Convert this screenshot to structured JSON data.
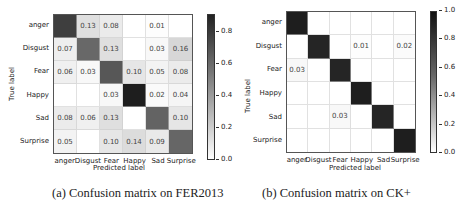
{
  "chart_data": [
    {
      "type": "heatmap",
      "title": "Confusion matrix on FER2013",
      "caption": "(a) Confusion matrix on FER2013",
      "xlabel": "Predicted label",
      "ylabel": "True label",
      "categories": [
        "anger",
        "Disgust",
        "Fear",
        "Happy",
        "Sad",
        "Surprise"
      ],
      "values": [
        [
          0.78,
          0.13,
          0.08,
          0.0,
          0.01,
          0.0
        ],
        [
          0.07,
          0.61,
          0.13,
          0.0,
          0.03,
          0.16
        ],
        [
          0.06,
          0.03,
          0.68,
          0.1,
          0.05,
          0.08
        ],
        [
          0.0,
          0.0,
          0.03,
          0.91,
          0.02,
          0.04
        ],
        [
          0.08,
          0.06,
          0.13,
          0.0,
          0.63,
          0.1
        ],
        [
          0.05,
          0.0,
          0.1,
          0.14,
          0.09,
          0.62
        ]
      ],
      "cell_labels": [
        [
          "",
          "0.13",
          "0.08",
          "",
          "0.01",
          ""
        ],
        [
          "0.07",
          "",
          "0.13",
          "",
          "0.03",
          "0.16"
        ],
        [
          "0.06",
          "0.03",
          "",
          "0.10",
          "0.05",
          "0.08"
        ],
        [
          "",
          "",
          "0.03",
          "",
          "0.02",
          "0.04"
        ],
        [
          "0.08",
          "0.06",
          "0.13",
          "",
          "",
          "0.10"
        ],
        [
          "0.05",
          "",
          "0.10",
          "0.14",
          "0.09",
          ""
        ]
      ],
      "colorbar": {
        "range": [
          0.0,
          0.91
        ],
        "ticks": [
          "0.0",
          "0.2",
          "0.4",
          "0.6",
          "0.8"
        ],
        "cmap": "Greys"
      }
    },
    {
      "type": "heatmap",
      "title": "Confusion matrix on CK+",
      "caption": "(b) Confusion matrix on CK+",
      "xlabel": "Predicted label",
      "ylabel": "True label",
      "categories": [
        "anger",
        "Disgust",
        "Fear",
        "Happy",
        "Sad",
        "Surprise"
      ],
      "values": [
        [
          1.0,
          0.0,
          0.0,
          0.0,
          0.0,
          0.0
        ],
        [
          0.0,
          0.97,
          0.0,
          0.01,
          0.0,
          0.02
        ],
        [
          0.03,
          0.0,
          0.97,
          0.0,
          0.0,
          0.0
        ],
        [
          0.0,
          0.0,
          0.0,
          1.0,
          0.0,
          0.0
        ],
        [
          0.0,
          0.0,
          0.03,
          0.0,
          0.97,
          0.0
        ],
        [
          0.0,
          0.0,
          0.0,
          0.0,
          0.0,
          1.0
        ]
      ],
      "cell_labels": [
        [
          "",
          "",
          "",
          "",
          "",
          ""
        ],
        [
          "",
          "",
          "",
          "0.01",
          "",
          "0.02"
        ],
        [
          "0.03",
          "",
          "",
          "",
          "",
          ""
        ],
        [
          "",
          "",
          "",
          "",
          "",
          ""
        ],
        [
          "",
          "",
          "0.03",
          "",
          "",
          ""
        ],
        [
          "",
          "",
          "",
          "",
          "",
          ""
        ]
      ],
      "colorbar": {
        "range": [
          0.0,
          1.0
        ],
        "ticks": [
          "0.0",
          "0.2",
          "0.4",
          "0.6",
          "0.8",
          "1.0"
        ],
        "cmap": "Greys"
      }
    }
  ]
}
